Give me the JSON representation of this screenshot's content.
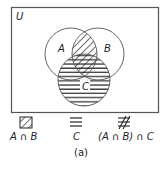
{
  "diagram": {
    "universe_label": "U",
    "sets": [
      {
        "label": "A",
        "cx": 71,
        "cy": 54,
        "r": 26
      },
      {
        "label": "B",
        "cx": 98,
        "cy": 54,
        "r": 26
      },
      {
        "label": "C",
        "cx": 84,
        "cy": 80,
        "r": 26
      }
    ],
    "shading": {
      "A_intersect_B": "diagonal-hatch",
      "C": "horizontal-lines"
    },
    "colors": {
      "stroke": "#555555",
      "hatch": "#222222",
      "background": "#ffffff"
    }
  },
  "legend": {
    "items": [
      {
        "symbol": "diagonal-hatch-icon",
        "label": "A ∩ B"
      },
      {
        "symbol": "horizontal-lines-icon",
        "label": "C"
      },
      {
        "symbol": "crosshatch-icon",
        "label": "(A ∩ B) ∩ C"
      }
    ]
  },
  "caption": "(a)"
}
